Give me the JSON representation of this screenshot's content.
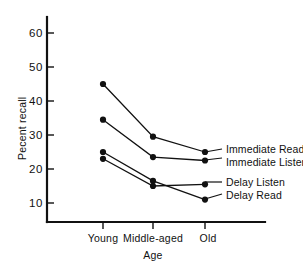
{
  "chart_data": {
    "type": "line",
    "title": "",
    "xlabel": "Age",
    "ylabel": "Pecent recall",
    "categories": [
      "Young",
      "Middle-aged",
      "Old"
    ],
    "ylim": [
      0,
      67
    ],
    "yticks": [
      10,
      20,
      30,
      40,
      50,
      60
    ],
    "ytick_labels": [
      "10",
      "20",
      "30",
      "40",
      "50",
      "60"
    ],
    "grid": false,
    "legend_position": "right-inline",
    "marker": "filled-circle",
    "series": [
      {
        "name": "Immediate Read",
        "values": [
          45,
          29.5,
          25
        ]
      },
      {
        "name": "Immediate Listen",
        "values": [
          34.5,
          23.5,
          22.5
        ]
      },
      {
        "name": "Delay Listen",
        "values": [
          23,
          15,
          15.5
        ]
      },
      {
        "name": "Delay Read",
        "values": [
          25,
          16.5,
          11
        ]
      }
    ]
  },
  "axes": {
    "y_title": "Pecent recall",
    "x_title": "Age",
    "y_tick_0": "10",
    "y_tick_1": "20",
    "y_tick_2": "30",
    "y_tick_3": "40",
    "y_tick_4": "50",
    "y_tick_5": "60",
    "x_cat_0": "Young",
    "x_cat_1": "Middle-aged",
    "x_cat_2": "Old"
  },
  "legend": {
    "item_0": "Immediate Read",
    "item_1": "Immediate Listen",
    "item_2": "Delay Listen",
    "item_3": "Delay Read"
  },
  "colors": {
    "ink": "#111111",
    "background": "#ffffff"
  }
}
